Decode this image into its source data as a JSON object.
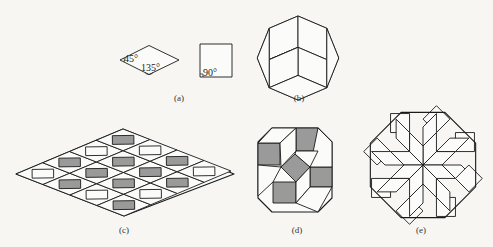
{
  "figure": {
    "panels": [
      {
        "id": "a",
        "label": "(a)",
        "description": "Prototiles: 45°/135° rhombus and square"
      },
      {
        "id": "b",
        "label": "(b)",
        "description": "Octagon tiled by rhombi"
      },
      {
        "id": "c",
        "label": "(c)",
        "description": "Large 45° rhombus tiled by rhombi and shaded squares"
      },
      {
        "id": "d",
        "label": "(d)",
        "description": "Octagon tiled with shaded squares and rhombi"
      },
      {
        "id": "e",
        "label": "(e)",
        "description": "Octagon with 8-fold star of rhombi and squares"
      }
    ],
    "angles": {
      "rhombus_acute": "45°",
      "rhombus_obtuse": "135°",
      "square": "90°"
    },
    "colors": {
      "stroke": "#1a1a1a",
      "shaded": "#9a9a9a",
      "white": "#fbfbfa",
      "background": "#f7f6f3"
    }
  }
}
